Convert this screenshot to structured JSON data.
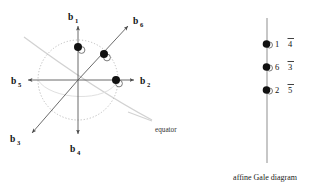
{
  "figure": {
    "title_caption": "affine Gale diagram",
    "equator_label": "equator",
    "left_diagram": {
      "name": "sphere-vector-diagram",
      "center": {
        "x": 78,
        "y": 80
      },
      "circle_radius": 40,
      "vectors": [
        {
          "id": "b1",
          "label": "b",
          "subscript": "1",
          "angle_deg": 90,
          "label_x": 71,
          "label_y": 17,
          "has_point": true,
          "point_r": 33
        },
        {
          "id": "b6",
          "label": "b",
          "subscript": "6",
          "angle_deg": 40,
          "label_x": 141,
          "label_y": 28,
          "has_point": true,
          "point_r": 29
        },
        {
          "id": "b2",
          "label": "b",
          "subscript": "2",
          "angle_deg": 0,
          "label_x": 146,
          "label_y": 84,
          "has_point": true,
          "point_r": 35
        },
        {
          "id": "b4",
          "label": "b",
          "subscript": "4",
          "angle_deg": 270,
          "label_x": 74,
          "label_y": 153,
          "has_point": false,
          "point_r": 0
        },
        {
          "id": "b5",
          "label": "b",
          "subscript": "5",
          "angle_deg": 180,
          "label_x": 14,
          "label_y": 84,
          "has_point": false,
          "point_r": 0
        },
        {
          "id": "b3",
          "label": "b",
          "subscript": "3",
          "angle_deg": 220,
          "label_x": 13,
          "label_y": 142,
          "has_point": false,
          "point_r": 0
        }
      ],
      "equator_label_x": 161,
      "equator_label_y": 131
    },
    "right_diagram": {
      "name": "affine-gale-diagram",
      "axis_x": 267,
      "axis_top": 18,
      "axis_bottom": 163,
      "rows": [
        {
          "dot_y": 44,
          "number": "1",
          "barred": "4"
        },
        {
          "dot_y": 67,
          "number": "6",
          "barred": "3"
        },
        {
          "dot_y": 90,
          "number": "2",
          "barred": "5"
        }
      ],
      "caption_x": 262,
      "caption_y": 178
    },
    "colors": {
      "ink": "#111111",
      "axis": "#888888",
      "circle_dotted": "#b8b8b8",
      "equator": "#cfcfcf",
      "arrow": "#4a4a4a"
    }
  }
}
